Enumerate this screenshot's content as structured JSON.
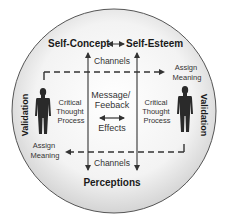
{
  "diagram": {
    "top": {
      "left_label": "Self-Concept",
      "right_label": "Self-Esteem"
    },
    "bottom_label": "Perceptions",
    "channels_top": "Channels",
    "channels_bottom": "Channels",
    "center": {
      "line1": "Message/",
      "line2": "Feeback",
      "line3": "Effects"
    },
    "left_process": {
      "line1": "Critical",
      "line2": "Thought",
      "line3": "Process"
    },
    "right_process": {
      "line1": "Critical",
      "line2": "Thought",
      "line3": "Process"
    },
    "assign_meaning_right": {
      "line1": "Assign",
      "line2": "Meaning"
    },
    "assign_meaning_left": {
      "line1": "Assign",
      "line2": "Meaning"
    },
    "validation_left": "Validation",
    "validation_right": "Validation",
    "colors": {
      "circle_fill_center": "#ffffff",
      "circle_fill_edge": "#d9d9d9",
      "circle_stroke": "#555555",
      "arrow": "#333333",
      "figure": "#2a2a2a"
    }
  }
}
